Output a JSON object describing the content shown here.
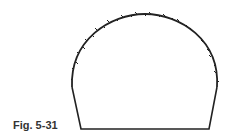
{
  "figure": {
    "caption": "Fig. 5-31",
    "stroke_color": "#222222",
    "shape": "arched-tunnel-outline"
  }
}
